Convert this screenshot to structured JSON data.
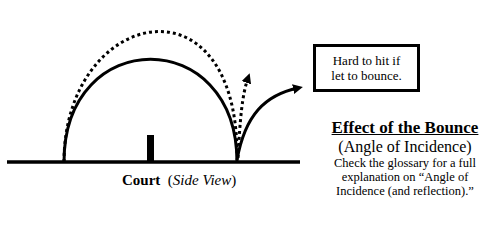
{
  "diagram": {
    "court_label": {
      "main": "Court",
      "qualifier": "Side View"
    },
    "callout": {
      "line1": "Hard to hit if",
      "line2": "let to bounce."
    },
    "effect": {
      "title": "Effect of the Bounce",
      "subtitle": "(Angle of Incidence)",
      "note_line1": "Check the glossary for a full",
      "note_line2": "explanation on “Angle of",
      "note_line3": "Incidence (and reflection).”"
    },
    "elements": {
      "court_line": "solid-ground-line",
      "net": "net-post",
      "solid_trajectory": "solid-arc-low-bounce",
      "dotted_trajectory": "dotted-arc-high-bounce"
    },
    "colors": {
      "ink": "#000000",
      "background": "#ffffff"
    }
  }
}
